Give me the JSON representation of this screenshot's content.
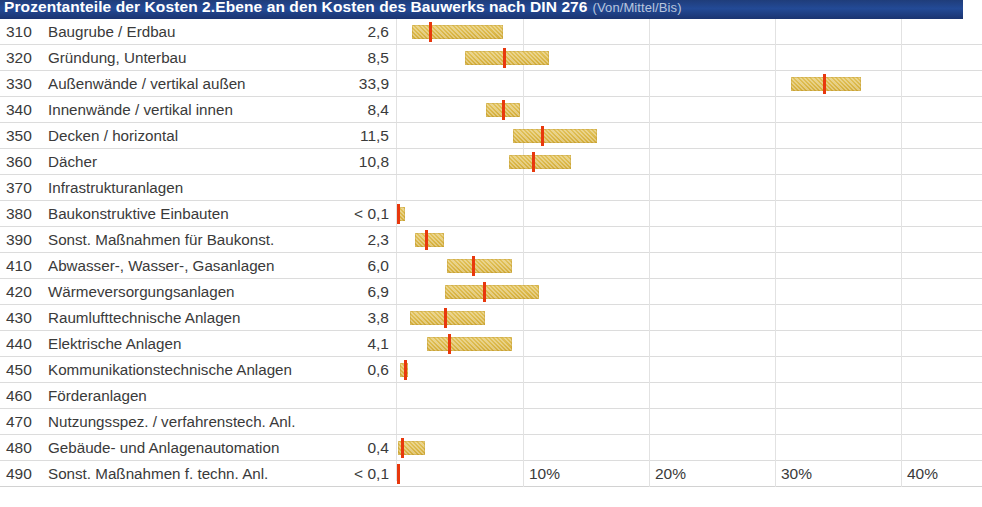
{
  "header": {
    "title": "Prozentanteile der Kosten 2.Ebene an den Kosten des Bauwerks nach DIN 276",
    "subtitle": "(Von/Mittel/Bis)",
    "bar_color": "#234a96",
    "title_color": "#ffffff",
    "subtitle_color": "#b9c5dc"
  },
  "colors": {
    "bar_fill": "#dcb94b",
    "marker": "#e8380d",
    "grid": "#e2e2e2",
    "text": "#3a3a3a"
  },
  "axis": {
    "ticks": [
      "10%",
      "20%",
      "30%",
      "40%"
    ],
    "tick_values": [
      10,
      20,
      30,
      40
    ],
    "min": 0,
    "max": 44,
    "px_origin": 397,
    "px_per_percent": 12.6
  },
  "chart_data": {
    "type": "bar",
    "title": "Prozentanteile der Kosten 2.Ebene an den Kosten des Bauwerks nach DIN 276",
    "subtitle": "(Von/Mittel/Bis)",
    "xlabel": "",
    "ylabel": "",
    "xlim": [
      0,
      44
    ],
    "grid": true,
    "legend": "none",
    "categories": [
      "310 Baugrube / Erdbau",
      "320 Gründung, Unterbau",
      "330 Außenwände / vertikal außen",
      "340 Innenwände / vertikal innen",
      "350 Decken / horizontal",
      "360 Dächer",
      "370 Infrastrukturanlagen",
      "380 Baukonstruktive Einbauten",
      "390 Sonst. Maßnahmen für Baukonst.",
      "410 Abwasser-, Wasser-, Gasanlagen",
      "420 Wärmeversorgungsanlagen",
      "430 Raumlufttechnische Anlagen",
      "440 Elektrische Anlagen",
      "450 Kommunikationstechnische Anlagen",
      "460 Förderanlagen",
      "470 Nutzungsspez. / verfahrenstech. Anl.",
      "480 Gebäude- und Anlagenautomation",
      "490 Sonst. Maßnahmen f. techn. Anl."
    ],
    "series": [
      {
        "name": "Von",
        "values": [
          1.2,
          5.4,
          31.3,
          7.1,
          9.2,
          8.9,
          null,
          0.0,
          1.4,
          4.0,
          3.8,
          1.0,
          2.4,
          0.2,
          null,
          null,
          0.1,
          0.0
        ]
      },
      {
        "name": "Mittel",
        "values": [
          2.6,
          8.5,
          33.9,
          8.4,
          11.5,
          10.8,
          null,
          0.05,
          2.3,
          6.0,
          6.9,
          3.8,
          4.1,
          0.6,
          null,
          null,
          0.4,
          0.05
        ]
      },
      {
        "name": "Bis",
        "values": [
          8.4,
          12.1,
          36.8,
          9.8,
          15.9,
          13.8,
          null,
          0.6,
          3.7,
          9.1,
          11.3,
          7.0,
          9.1,
          0.9,
          null,
          null,
          2.2,
          0.2
        ]
      }
    ]
  },
  "rows": [
    {
      "code": "310",
      "label": "Baugrube / Erdbau",
      "value": "2,6",
      "from": 1.2,
      "mid": 2.6,
      "to": 8.4
    },
    {
      "code": "320",
      "label": "Gründung, Unterbau",
      "value": "8,5",
      "from": 5.4,
      "mid": 8.5,
      "to": 12.1
    },
    {
      "code": "330",
      "label": "Außenwände / vertikal außen",
      "value": "33,9",
      "from": 31.3,
      "mid": 33.9,
      "to": 36.8
    },
    {
      "code": "340",
      "label": "Innenwände / vertikal innen",
      "value": "8,4",
      "from": 7.1,
      "mid": 8.4,
      "to": 9.8
    },
    {
      "code": "350",
      "label": "Decken / horizontal",
      "value": "11,5",
      "from": 9.2,
      "mid": 11.5,
      "to": 15.9
    },
    {
      "code": "360",
      "label": "Dächer",
      "value": "10,8",
      "from": 8.9,
      "mid": 10.8,
      "to": 13.8
    },
    {
      "code": "370",
      "label": "Infrastrukturanlagen",
      "value": "",
      "from": null,
      "mid": null,
      "to": null
    },
    {
      "code": "380",
      "label": "Baukonstruktive Einbauten",
      "value": "< 0,1",
      "from": 0.0,
      "mid": 0.05,
      "to": 0.6
    },
    {
      "code": "390",
      "label": "Sonst. Maßnahmen für Baukonst.",
      "value": "2,3",
      "from": 1.4,
      "mid": 2.3,
      "to": 3.7
    },
    {
      "code": "410",
      "label": "Abwasser-, Wasser-, Gasanlagen",
      "value": "6,0",
      "from": 4.0,
      "mid": 6.0,
      "to": 9.1
    },
    {
      "code": "420",
      "label": "Wärmeversorgungsanlagen",
      "value": "6,9",
      "from": 3.8,
      "mid": 6.9,
      "to": 11.3
    },
    {
      "code": "430",
      "label": "Raumlufttechnische Anlagen",
      "value": "3,8",
      "from": 1.0,
      "mid": 3.8,
      "to": 7.0
    },
    {
      "code": "440",
      "label": "Elektrische Anlagen",
      "value": "4,1",
      "from": 2.4,
      "mid": 4.1,
      "to": 9.1
    },
    {
      "code": "450",
      "label": "Kommunikationstechnische Anlagen",
      "value": "0,6",
      "from": 0.2,
      "mid": 0.6,
      "to": 0.9
    },
    {
      "code": "460",
      "label": "Förderanlagen",
      "value": "",
      "from": null,
      "mid": null,
      "to": null
    },
    {
      "code": "470",
      "label": "Nutzungsspez. / verfahrenstech. Anl.",
      "value": "",
      "from": null,
      "mid": null,
      "to": null
    },
    {
      "code": "480",
      "label": "Gebäude- und Anlagenautomation",
      "value": "0,4",
      "from": 0.1,
      "mid": 0.4,
      "to": 2.2
    },
    {
      "code": "490",
      "label": "Sonst. Maßnahmen f. techn. Anl.",
      "value": "< 0,1",
      "from": 0.0,
      "mid": 0.05,
      "to": 0.2
    }
  ]
}
